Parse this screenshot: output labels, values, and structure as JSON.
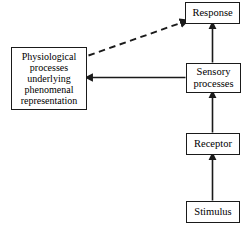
{
  "diagram": {
    "type": "flow-diagram",
    "background_color": "#ffffff",
    "line_color": "#1a1a1a",
    "text_color": "#000000",
    "nodes": [
      {
        "id": "response",
        "label": "Response",
        "shape": "rectangle"
      },
      {
        "id": "sensory",
        "label": "Sensory\nprocesses",
        "shape": "rectangle"
      },
      {
        "id": "receptor",
        "label": "Receptor",
        "shape": "rectangle"
      },
      {
        "id": "stimulus",
        "label": "Stimulus",
        "shape": "rectangle"
      },
      {
        "id": "physiological",
        "label": "Physiological\nprocesses\nunderlying\nphenomenal\nrepresentation",
        "shape": "rectangle"
      }
    ],
    "edges": [
      {
        "id": "stimulus-to-receptor",
        "from": "stimulus",
        "to": "receptor",
        "style": "solid",
        "arrow": "single"
      },
      {
        "id": "receptor-to-sensory",
        "from": "receptor",
        "to": "sensory",
        "style": "solid",
        "arrow": "single"
      },
      {
        "id": "sensory-to-response",
        "from": "sensory",
        "to": "response",
        "style": "solid",
        "arrow": "single"
      },
      {
        "id": "sensory-to-physiological",
        "from": "sensory",
        "to": "physiological",
        "style": "solid",
        "arrow": "single"
      },
      {
        "id": "physiological-to-response",
        "from": "physiological",
        "to": "response",
        "style": "dashed",
        "arrow": "single"
      }
    ]
  }
}
